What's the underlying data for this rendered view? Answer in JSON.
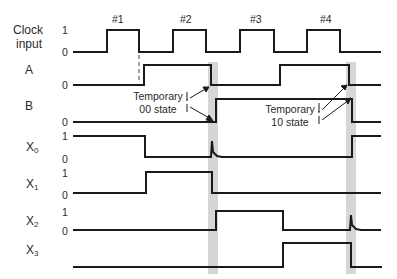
{
  "diagram": {
    "type": "timing-diagram",
    "signals": [
      {
        "id": "clock",
        "label": "Clock",
        "label2": "input",
        "high_label": "1",
        "low_label": "0"
      },
      {
        "id": "A",
        "label": "A",
        "low_label": "0"
      },
      {
        "id": "B",
        "label": "B",
        "low_label": "0"
      },
      {
        "id": "X0",
        "label": "X",
        "sub": "0",
        "high_label": "1",
        "low_label": "0"
      },
      {
        "id": "X1",
        "label": "X",
        "sub": "1",
        "high_label": "1",
        "low_label": "0"
      },
      {
        "id": "X2",
        "label": "X",
        "sub": "2",
        "high_label": "1",
        "low_label": "0"
      },
      {
        "id": "X3",
        "label": "X",
        "sub": "3"
      }
    ],
    "clock_pulses": [
      "#1",
      "#2",
      "#3",
      "#4"
    ],
    "annotations": [
      {
        "line1": "Temporary",
        "line2": "00 state"
      },
      {
        "line1": "Temporary",
        "line2": "10 state"
      }
    ],
    "colors": {
      "line": "#1a1a1a",
      "highlight": "#d4d4d4"
    }
  }
}
